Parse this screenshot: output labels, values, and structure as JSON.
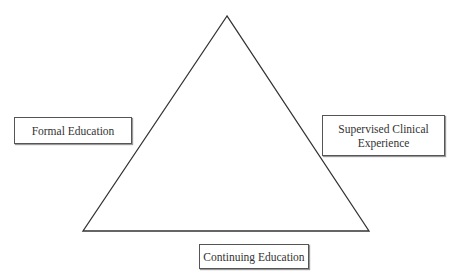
{
  "diagram": {
    "shape": "triangle",
    "labels": {
      "left": "Formal Education",
      "right_line1": "Supervised Clinical",
      "right_line2": "Experience",
      "bottom": "Continuing Education"
    },
    "colors": {
      "line": "#333333",
      "box_border": "#555555",
      "text": "#333333"
    }
  }
}
